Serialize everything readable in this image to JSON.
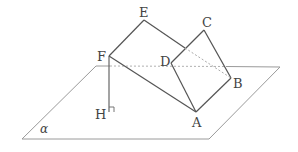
{
  "figure": {
    "labels": {
      "A": "A",
      "B": "B",
      "C": "C",
      "D": "D",
      "E": "E",
      "F": "F",
      "H": "H",
      "plane": "α"
    },
    "colors": {
      "solid_line": "#555555",
      "plane_line": "#999999",
      "dashed_line": "#aaaaaa",
      "label": "#444444"
    }
  }
}
